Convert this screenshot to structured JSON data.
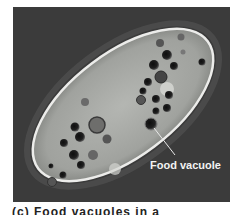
{
  "figure": {
    "label": "Food vacuole",
    "caption_partial": "(c) Food vacuoles in a paramecium",
    "colors": {
      "background": "#3a3a3a",
      "cell_body": "#a8aaa6",
      "cell_edge": "#e8e8e4",
      "vacuole": "#1c1c1c",
      "label_text": "#f2f2f2"
    }
  }
}
